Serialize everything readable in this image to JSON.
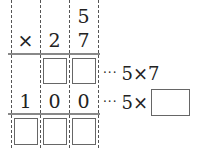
{
  "problem": {
    "type": "column-multiplication",
    "operator": "×",
    "top_row": [
      "",
      "",
      "5"
    ],
    "multiplier_row": [
      "×",
      "2",
      "7"
    ],
    "partial_row_1": [
      "",
      "box",
      "box"
    ],
    "partial_row_2": [
      "1",
      "0",
      "0"
    ],
    "result_row": [
      "box",
      "box",
      "box"
    ],
    "annotation_1": {
      "dots": "···",
      "text": "5×7"
    },
    "annotation_2": {
      "dots": "···",
      "text": "5×",
      "blank": true
    }
  }
}
